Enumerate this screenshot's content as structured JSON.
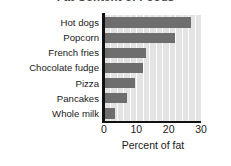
{
  "chart_data": {
    "type": "bar",
    "orientation": "horizontal",
    "title": "Fat Content of Foods",
    "xlabel": "Percent of fat",
    "ylabel": "",
    "categories": [
      "Hot dogs",
      "Popcorn",
      "French fries",
      "Chocolate fudge",
      "Pizza",
      "Pancakes",
      "Whole milk"
    ],
    "values": [
      27,
      22,
      13,
      12,
      9.5,
      7,
      3.5
    ],
    "xlim": [
      0,
      30
    ],
    "xticks": [
      0,
      10,
      20,
      30
    ],
    "xtick_labels": [
      "0",
      "10",
      "20",
      "30"
    ],
    "gridlines": [
      2,
      4,
      6,
      8,
      10,
      12,
      14,
      16,
      18,
      20,
      22,
      24,
      26,
      28
    ],
    "grid": true,
    "grid_axis": "x",
    "legend": null,
    "bar_color": "#6e6e6e",
    "plot_background": "#e3e3e3",
    "gridline_color": "#ffffff",
    "axis_color": "#111111",
    "title_color": "#4b4b4b"
  }
}
